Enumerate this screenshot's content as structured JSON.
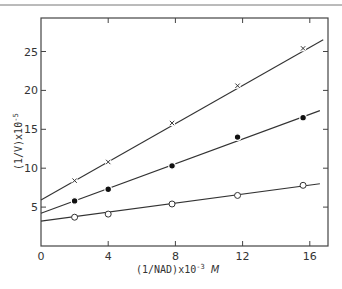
{
  "chart_data": {
    "type": "scatter",
    "title": "",
    "xlabel": "(1/NAD)x10⁻³ M",
    "ylabel": "(1/V)x10⁻⁵",
    "xlim": [
      0,
      17
    ],
    "ylim": [
      0,
      29
    ],
    "x_ticks": [
      0,
      4,
      8,
      12,
      16
    ],
    "y_ticks": [
      5,
      10,
      15,
      20,
      25
    ],
    "grid": false,
    "legend": null,
    "series": [
      {
        "name": "cross",
        "marker": "x",
        "x": [
          2.0,
          4.0,
          7.8,
          11.7,
          15.6
        ],
        "y": [
          8.4,
          10.8,
          15.8,
          20.6,
          25.4
        ],
        "fit_line": {
          "x": [
            0,
            16.8
          ],
          "y": [
            5.9,
            26.5
          ]
        }
      },
      {
        "name": "filled-circle",
        "marker": "filled-circle",
        "x": [
          2.0,
          4.0,
          7.8,
          11.7,
          15.6
        ],
        "y": [
          5.8,
          7.3,
          10.3,
          14.0,
          16.5
        ],
        "fit_line": {
          "x": [
            0,
            16.6
          ],
          "y": [
            4.2,
            17.4
          ]
        }
      },
      {
        "name": "open-circle",
        "marker": "open-circle",
        "x": [
          2.0,
          4.0,
          7.8,
          11.7,
          15.6
        ],
        "y": [
          3.7,
          4.1,
          5.4,
          6.5,
          7.8
        ],
        "fit_line": {
          "x": [
            0,
            16.6
          ],
          "y": [
            3.2,
            8.0
          ]
        }
      }
    ]
  },
  "axes": {
    "x_tick_labels": [
      "0",
      "4",
      "8",
      "12",
      "16"
    ],
    "y_tick_labels": [
      "5",
      "10",
      "15",
      "20",
      "25"
    ],
    "xlabel_main": "(1/NAD)x10",
    "xlabel_exp": "-3",
    "xlabel_unit": "M",
    "ylabel_main": "(1/V)x10",
    "ylabel_exp": "-5"
  }
}
